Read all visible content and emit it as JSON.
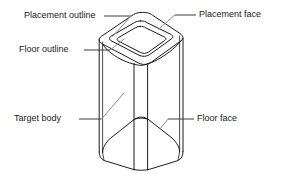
{
  "diagram": {
    "type": "isometric-line-drawing",
    "background_color": "#ffffff",
    "line_color": "#1b1b1b",
    "leader_color": "#3a3a3a",
    "labels": [
      {
        "id": "placement-outline",
        "text": "Placement outline",
        "side": "left",
        "points_to": "middle nested outline on top face"
      },
      {
        "id": "floor-outline",
        "text": "Floor outline",
        "side": "left",
        "points_to": "inner nested outline on top face"
      },
      {
        "id": "target-body",
        "text": "Target body",
        "side": "left",
        "points_to": "front left wall of the prism"
      },
      {
        "id": "placement-face",
        "text": "Placement face",
        "side": "right",
        "points_to": "top face of the prism"
      },
      {
        "id": "floor-face",
        "text": "Floor face",
        "side": "right",
        "points_to": "interior floor surface inside the prism"
      }
    ]
  }
}
